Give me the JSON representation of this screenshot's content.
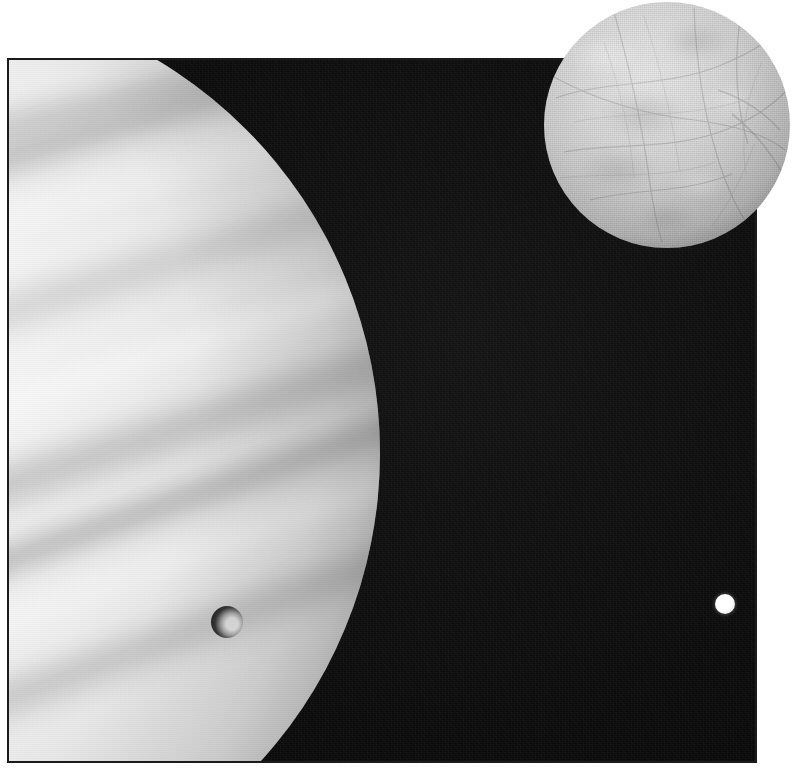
{
  "document": {
    "kind": "astronomical-photograph",
    "palette": "grayscale",
    "caption": "",
    "background_color": "#ffffff"
  },
  "plate": {
    "name": "space-plate",
    "border_color": "#1b1b1b",
    "space_color": "#0c0c0c",
    "left": 7,
    "top": 58,
    "width": 750,
    "height": 705
  },
  "objects": {
    "planet": {
      "label": "gas-giant-planet",
      "description": "Large banded gas giant, partially visible at left edge; bright limb with horizontal diagonal cloud belts",
      "highlight_color": "#fdfdfd",
      "shadow_color": "#6b6b6b",
      "visible_fraction": "partial-disc"
    },
    "icy_moon": {
      "label": "large-icy-moon",
      "description": "Fully illuminated icy moon with mottled surface and fine linea cracks, overlapping the upper-right corner of the plate",
      "center_x": 667,
      "center_y": 125,
      "radius": 123,
      "surface_color": "#cdcdcd"
    },
    "small_moon": {
      "label": "small-bright-moon",
      "description": "Small unresolved bright moon against deep space at right",
      "center_x": 723,
      "center_y": 602,
      "radius": 10,
      "surface_color": "#ffffff"
    },
    "shadow_transit": {
      "label": "moon-shadow-transit",
      "description": "Dark circular moon shadow cast on the planet's cloud tops, with a bright crescent highlight on its trailing side",
      "center_x": 225,
      "center_y": 620,
      "radius": 16,
      "shadow_color": "#191919"
    }
  },
  "bands": [
    {
      "id": "b9",
      "tone": "dark",
      "top": 120,
      "height": 44,
      "angle": -14,
      "opacity": 0.42
    },
    {
      "id": "b1",
      "tone": "dark",
      "top": 150,
      "height": 52,
      "angle": -16,
      "opacity": 0.5
    },
    {
      "id": "b2",
      "tone": "light",
      "top": 222,
      "height": 34,
      "angle": -16,
      "opacity": 0.38
    },
    {
      "id": "b3",
      "tone": "dark",
      "top": 300,
      "height": 60,
      "angle": -17,
      "opacity": 0.3
    },
    {
      "id": "b4",
      "tone": "light",
      "top": 402,
      "height": 40,
      "angle": -18,
      "opacity": 0.55
    },
    {
      "id": "b5",
      "tone": "dark",
      "top": 470,
      "height": 70,
      "angle": -18,
      "opacity": 0.45
    },
    {
      "id": "b6",
      "tone": "dark",
      "top": 556,
      "height": 46,
      "angle": -19,
      "opacity": 0.6
    },
    {
      "id": "b7",
      "tone": "light",
      "top": 628,
      "height": 30,
      "angle": -20,
      "opacity": 0.5
    },
    {
      "id": "b8",
      "tone": "dark",
      "top": 690,
      "height": 58,
      "angle": -20,
      "opacity": 0.42
    }
  ]
}
